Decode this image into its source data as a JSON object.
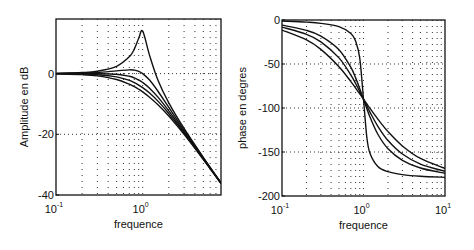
{
  "chart_data": [
    {
      "type": "line",
      "title": "",
      "xlabel": "frequence",
      "ylabel": "Amplitude en dB",
      "xscale": "log",
      "xlim": [
        0.1,
        8
      ],
      "ylim": [
        -40,
        18
      ],
      "grid": true,
      "grid_style": "dotted",
      "legend": null,
      "xticks": [
        {
          "value": 0.1,
          "base": "10",
          "exp": "-1"
        },
        {
          "value": 1,
          "base": "10",
          "exp": "0"
        }
      ],
      "yticks": [
        {
          "value": 0,
          "label": "0"
        },
        {
          "value": -20,
          "label": "-20"
        },
        {
          "value": -40,
          "label": "-40"
        }
      ],
      "x": [
        0.1,
        0.2,
        0.3,
        0.5,
        0.7,
        0.8,
        0.9,
        1.0,
        1.2,
        1.5,
        2,
        3,
        5,
        8
      ],
      "series": [
        {
          "name": "zeta=0.1",
          "values": [
            0.09,
            0.35,
            0.8,
            2.42,
            5.53,
            8.09,
            11.64,
            13.98,
            6.0,
            -2.18,
            -9.62,
            -18.08,
            -27.6,
            -35.99
          ]
        },
        {
          "name": "zeta=0.5",
          "values": [
            0.04,
            0.17,
            0.37,
            0.9,
            1.25,
            1.14,
            0.73,
            0.0,
            -2.13,
            -5.81,
            -11.14,
            -18.63,
            -27.79,
            -36.06
          ]
        },
        {
          "name": "zeta=0.7",
          "values": [
            0.0,
            0.0,
            -0.02,
            -0.22,
            -0.87,
            -1.41,
            -2.11,
            -2.92,
            -4.79,
            -7.76,
            -12.26,
            -19.12,
            -27.96,
            -36.12
          ]
        },
        {
          "name": "zeta=0.85",
          "values": [
            -0.04,
            -0.16,
            -0.37,
            -1.09,
            -2.24,
            -2.96,
            -3.76,
            -4.61,
            -6.39,
            -9.07,
            -13.13,
            -19.54,
            -28.12,
            -36.18
          ]
        },
        {
          "name": "zeta=1.0",
          "values": [
            -0.09,
            -0.34,
            -0.75,
            -1.94,
            -3.48,
            -4.3,
            -5.14,
            -6.02,
            -7.79,
            -10.22,
            -13.98,
            -20.0,
            -28.3,
            -36.2
          ]
        }
      ]
    },
    {
      "type": "line",
      "title": "",
      "xlabel": "frequence",
      "ylabel": "phase en degres",
      "xscale": "log",
      "xlim": [
        0.1,
        10
      ],
      "ylim": [
        -200,
        0
      ],
      "grid": true,
      "grid_style": "dotted",
      "legend": null,
      "xticks": [
        {
          "value": 0.1,
          "base": "10",
          "exp": "-1"
        },
        {
          "value": 1,
          "base": "10",
          "exp": "0"
        },
        {
          "value": 10,
          "base": "10",
          "exp": "1"
        }
      ],
      "yticks": [
        {
          "value": 0,
          "label": "0"
        },
        {
          "value": -50,
          "label": "-50"
        },
        {
          "value": -100,
          "label": "-100"
        },
        {
          "value": -150,
          "label": "-150"
        },
        {
          "value": -200,
          "label": "-200"
        }
      ],
      "x": [
        0.1,
        0.2,
        0.3,
        0.5,
        0.7,
        0.8,
        0.9,
        1.0,
        1.1,
        1.2,
        1.5,
        2,
        3,
        5,
        10
      ],
      "series": [
        {
          "name": "zeta=0.1",
          "values": [
            -1.16,
            -2.39,
            -3.77,
            -7.59,
            -15.35,
            -23.96,
            -43.45,
            -90,
            -133.67,
            -151.39,
            -166.5,
            -172.4,
            -175.7,
            -177.6,
            -178.8
          ]
        },
        {
          "name": "zeta=0.5",
          "values": [
            -5.77,
            -11.77,
            -18.25,
            -33.69,
            -53.93,
            -65.77,
            -78.08,
            -90,
            -100.81,
            -110.14,
            -129.81,
            -146.31,
            -159.44,
            -168.23,
            -174.23
          ]
        },
        {
          "name": "zeta=0.7",
          "values": [
            -8.05,
            -16.26,
            -24.78,
            -43.03,
            -62.51,
            -72.18,
            -81.42,
            -90,
            -97.77,
            -104.68,
            -120.76,
            -136.97,
            -152.3,
            -163.74,
            -171.95
          ]
        },
        {
          "name": "zeta=1.0",
          "values": [
            -11.42,
            -22.62,
            -33.4,
            -53.13,
            -69.98,
            -77.32,
            -83.97,
            -90,
            -95.45,
            -100.39,
            -112.62,
            -126.87,
            -143.13,
            -157.38,
            -168.58
          ]
        }
      ]
    }
  ],
  "layout": {
    "panels": [
      {
        "left": 56,
        "top": 19,
        "right": 221,
        "bottom": 195
      },
      {
        "left": 282,
        "top": 20,
        "right": 445,
        "bottom": 196
      }
    ]
  },
  "colors": {
    "line": "#111111",
    "grid": "#333333",
    "background": "#ffffff"
  }
}
